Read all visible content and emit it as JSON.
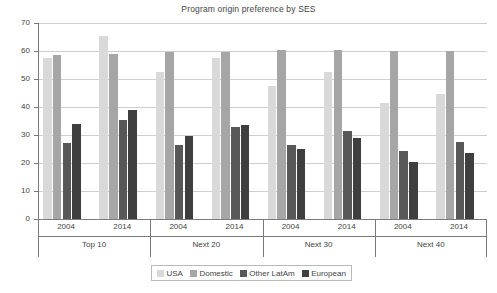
{
  "chart_data": {
    "type": "bar",
    "title": "Program origin preference by SES",
    "xlabel": "",
    "ylabel": "",
    "ylim": [
      0,
      70
    ],
    "yticks": [
      0,
      10,
      20,
      30,
      40,
      50,
      60,
      70
    ],
    "grid": true,
    "legend_position": "bottom",
    "categories": [
      "Top 10 2004",
      "Top 10 2014",
      "Next 20 2004",
      "Next 20 2014",
      "Next 30 2004",
      "Next 30 2014",
      "Next 40 2004",
      "Next 40 2014"
    ],
    "groups": [
      {
        "label": "Top 10",
        "years": [
          "2004",
          "2014"
        ]
      },
      {
        "label": "Next 20",
        "years": [
          "2004",
          "2014"
        ]
      },
      {
        "label": "Next 30",
        "years": [
          "2004",
          "2014"
        ]
      },
      {
        "label": "Next 40",
        "years": [
          "2004",
          "2014"
        ]
      }
    ],
    "series": [
      {
        "name": "USA",
        "color": "#d9d9d9",
        "values": [
          57.5,
          65.5,
          52.5,
          57.5,
          47.5,
          52.5,
          41.5,
          44.8
        ]
      },
      {
        "name": "Domestic",
        "color": "#a6a6a6",
        "values": [
          58.5,
          59.0,
          59.5,
          59.5,
          60.3,
          60.3,
          60.0,
          60.0
        ]
      },
      {
        "name": "Other LatAm",
        "color": "#585858",
        "values": [
          27.0,
          35.5,
          26.5,
          33.0,
          26.5,
          31.5,
          24.2,
          27.6
        ]
      },
      {
        "name": "European",
        "color": "#3f3f3f",
        "values": [
          34.0,
          39.0,
          29.5,
          33.5,
          25.0,
          29.0,
          20.3,
          23.7
        ]
      }
    ]
  }
}
